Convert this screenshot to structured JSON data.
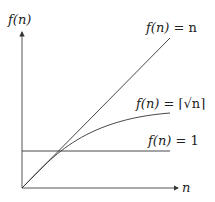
{
  "diagram": {
    "y_axis_label": "f(n)",
    "x_axis_label": "n",
    "curves": [
      {
        "name": "linear",
        "label_f": "f(n)",
        "label_eq": " = n"
      },
      {
        "name": "sqrt",
        "label_f": "f(n)",
        "label_eq": " = ⌈√n⌉"
      },
      {
        "name": "constant",
        "label_f": "f(n)",
        "label_eq": " = 1"
      }
    ],
    "colors": {
      "line": "#333333",
      "background": "#ffffff"
    }
  }
}
